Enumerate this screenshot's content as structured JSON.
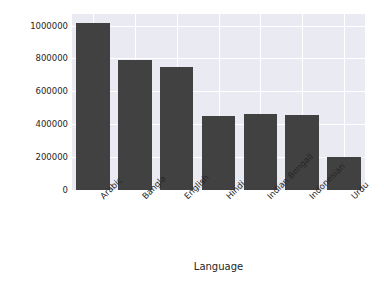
{
  "chart_data": {
    "type": "bar",
    "title": "",
    "xlabel": "Language",
    "ylabel": "Vocabulary Size",
    "categories": [
      "Arabic",
      "Bangla",
      "English",
      "Hindi",
      "Indian Bengali",
      "Indonesian",
      "Urdu"
    ],
    "values": [
      1015000,
      790000,
      750000,
      450000,
      460000,
      455000,
      200000
    ],
    "ylim": [
      0,
      1070000
    ],
    "yticks": [
      0,
      200000,
      400000,
      600000,
      800000,
      1000000
    ],
    "ytick_labels": [
      "0",
      "200000",
      "400000",
      "600000",
      "800000",
      "1000000"
    ],
    "grid": true,
    "legend": null,
    "colors": {
      "bar": "#414141",
      "plot_background": "#eaeaf2",
      "gridline": "#ffffff",
      "figure_background": "#ffffff",
      "text": "#262626"
    }
  }
}
